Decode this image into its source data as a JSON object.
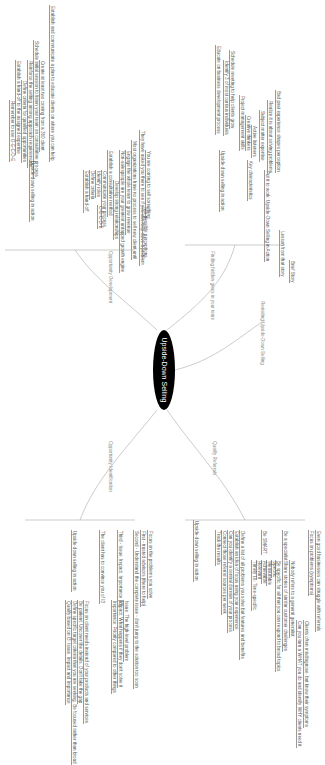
{
  "central_topic": "Upside-Down Selling",
  "branches": {
    "qualify": {
      "label": "Qualify Referrals",
      "items": [
        "Even good businesses can struggle with referrals",
        "Focus on problems (symptoms)",
        "Clients often misdiagnose, but know their symptoms",
        "Can you turn a WHAT you do and identify WHY clients need it",
        "Nobody refers to a general generalist",
        "Be a specialist",
        "Share stories of similar customer challenges",
        "Be specific for all that you can respond to broad topics",
        "Be SMART",
        "Specific",
        "Measurable",
        "Achievable",
        "Relevant",
        "Timely i.e. Time-specific",
        "Define a list of all problems you solve but features and benefits",
        "Establish an idea of focus using your experience",
        "Can you identify a central domain of your process",
        "Connect those referral sources per week",
        "Track the results",
        "Upside-down selling in action"
      ]
    },
    "opportunity_identification": {
      "label": "Opportunity Identification",
      "items": [
        "Focus on the problems you solve",
        "First - trusted advisors (there to help)",
        "Second - Understand the complete issue - don't jump to the solution too soon",
        "Issue: The high-level problem",
        "Impact: What happens if they don't solve it",
        "Importance: Priority compared to other things",
        "Third - Issue, Impact, Importance (I3)",
        "The client has to convince you of I3",
        "Focus on client needs instead of your products and services",
        "Be patient: Uncover the details. Don't take the gap",
        "Define specific target criteria that you are seeking. Be focused rather than broad",
        "Qualify based on I3: Issue, Impact and Importance",
        "Upside-down selling in action"
      ]
    },
    "opportunity_development": {
      "label": "Opportunity Development",
      "items": [
        "They have asked you there to see if you can help solve a problem",
        "You are coming to sell something",
        "Two possible perceptions",
        "Most organizations have no process to sell new client until",
        "Engage the whole team to grow revenue",
        "Non-salespeople are your greatest untapped growth engine",
        "Develop strong relationships",
        "Establish a consultative method",
        "Communicate your process",
        "Identify roles",
        "Define criteria",
        "O-E-C-D-E",
        "Establish a hand-off",
        "Establish and communicate a plan to educate clients on where you can help",
        "Create at least two coming from a 360 client",
        "Schedule initial session to listen your team on consultative process",
        "Reinforce the setting among approach requirements",
        "Define criteria for qualified opportunities",
        "Establish a hand-off to the assigned expertise",
        "Remember to use O-E-C-D-E",
        "Upside-down selling in action"
      ]
    },
    "finding_hidden_opportunities": {
      "label": "Finding hidden gems in your team",
      "items": [
        "Brief Story",
        "Lesson from that story",
        "Put it to work: Upside-Down Selling in Action",
        "Bad past experience shapes perception",
        "Realize it is about solving problems",
        "Subject matter expertise",
        "Active listeners",
        "Creative thinkers",
        "Project management skills",
        "Key characteristics",
        "Schedule meeting to help clients grow",
        "Identify 3 of most curious individuals",
        "Educate on business development process",
        "Upside-down selling in action"
      ]
    },
    "revisiting": {
      "label": "Revisiting Upside-Down Selling"
    }
  }
}
